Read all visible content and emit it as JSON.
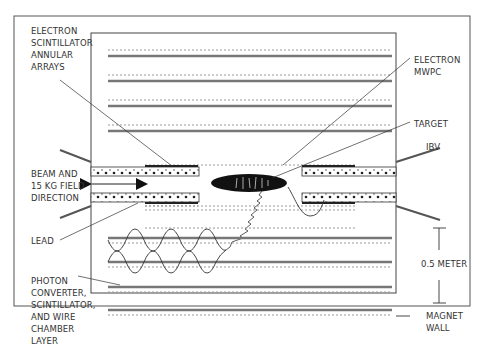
{
  "labels": {
    "electron_scintillator": [
      "ELECTRON",
      "SCINTILLATOR",
      "ANNULAR",
      "ARRAYS"
    ],
    "electron_mwpc": [
      "ELECTRON",
      "MWPC"
    ],
    "target": "TARGET",
    "ibv": "IBV",
    "beam": [
      "BEAM AND",
      "15 KG FIELD",
      "DIRECTION"
    ],
    "lead": "LEAD",
    "photon": [
      "PHOTON",
      "CONVERTER,",
      "SCINTILLATOR,",
      "AND WIRE",
      "CHAMBER",
      "LAYER"
    ],
    "scale": "0.5 METER",
    "magnet_wall": [
      "MAGNET",
      "WALL"
    ]
  },
  "colors": {
    "line": "#333333",
    "layer": "#777777",
    "dashed": "#999999",
    "target_fill": "#111111"
  }
}
